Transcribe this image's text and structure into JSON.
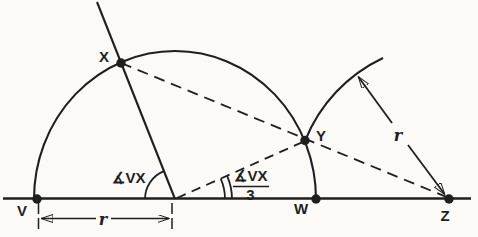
{
  "figure": {
    "labels": {
      "point_v": "V",
      "point_w": "W",
      "point_x": "X",
      "point_y": "Y",
      "point_z": "Z",
      "angle_vx": "∡VX",
      "fraction_numerator": "∡VX",
      "fraction_denominator": "3",
      "radius_dimension": "r",
      "radius_from_z": "r"
    }
  },
  "colors": {
    "ink": "#1f1f1f",
    "paper": "#fbfaf7"
  }
}
